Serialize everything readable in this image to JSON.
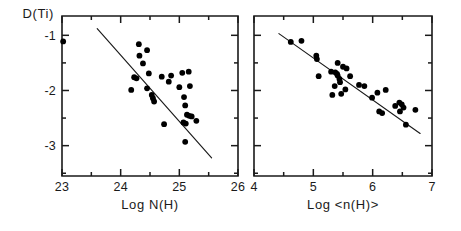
{
  "figure": {
    "background_color": "#ffffff",
    "ink_color": "#000000",
    "panel_count": 2
  },
  "chart_data": [
    {
      "type": "scatter",
      "panel_id": "left",
      "title": "",
      "xlabel": "Log N(H)",
      "ylabel": "D(Ti)",
      "xlim": [
        23,
        26
      ],
      "ylim": [
        -3.55,
        -0.65
      ],
      "xticks": [
        23,
        24,
        25,
        26
      ],
      "xticklabels": [
        "23",
        "24",
        "25",
        "26"
      ],
      "yticks": [
        -1,
        -2,
        -3
      ],
      "yticklabels": [
        "-1",
        "-2",
        "-3"
      ],
      "grid": false,
      "legend": "none",
      "marker": "filled-circle",
      "points": [
        [
          23.02,
          -1.11
        ],
        [
          24.31,
          -1.16
        ],
        [
          24.45,
          -1.27
        ],
        [
          24.32,
          -1.37
        ],
        [
          24.38,
          -1.51
        ],
        [
          24.48,
          -1.69
        ],
        [
          24.23,
          -1.76
        ],
        [
          24.27,
          -1.78
        ],
        [
          24.7,
          -1.75
        ],
        [
          24.86,
          -1.73
        ],
        [
          25.05,
          -1.68
        ],
        [
          25.16,
          -1.66
        ],
        [
          24.82,
          -1.84
        ],
        [
          24.18,
          -1.99
        ],
        [
          24.45,
          -1.96
        ],
        [
          24.53,
          -2.08
        ],
        [
          24.55,
          -2.14
        ],
        [
          24.57,
          -2.2
        ],
        [
          25.0,
          -1.94
        ],
        [
          25.18,
          -1.92
        ],
        [
          25.08,
          -2.12
        ],
        [
          25.1,
          -2.27
        ],
        [
          24.74,
          -2.61
        ],
        [
          25.13,
          -2.44
        ],
        [
          25.17,
          -2.46
        ],
        [
          25.21,
          -2.47
        ],
        [
          25.07,
          -2.58
        ],
        [
          25.11,
          -2.6
        ],
        [
          25.29,
          -2.55
        ],
        [
          25.1,
          -2.93
        ]
      ],
      "fit_line": {
        "x_start": 23.6,
        "y_start": -0.88,
        "x_end": 25.55,
        "y_end": -3.22
      }
    },
    {
      "type": "scatter",
      "panel_id": "right",
      "title": "",
      "xlabel": "Log <n(H)>",
      "ylabel": "D(Ti)",
      "xlim": [
        4,
        7
      ],
      "ylim": [
        -3.55,
        -0.65
      ],
      "xticks": [
        4,
        5,
        6,
        7
      ],
      "xticklabels": [
        "4",
        "5",
        "6",
        "7"
      ],
      "yticks": [
        -1,
        -2,
        -3
      ],
      "yticklabels": [
        "",
        "",
        ""
      ],
      "grid": false,
      "legend": "none",
      "marker": "filled-circle",
      "points": [
        [
          4.62,
          -1.12
        ],
        [
          4.8,
          -1.1
        ],
        [
          5.05,
          -1.37
        ],
        [
          5.06,
          -1.43
        ],
        [
          5.41,
          -1.5
        ],
        [
          5.5,
          -1.57
        ],
        [
          5.56,
          -1.6
        ],
        [
          5.3,
          -1.66
        ],
        [
          5.37,
          -1.67
        ],
        [
          5.4,
          -1.7
        ],
        [
          5.41,
          -1.73
        ],
        [
          5.09,
          -1.74
        ],
        [
          5.62,
          -1.74
        ],
        [
          5.44,
          -1.79
        ],
        [
          5.45,
          -1.85
        ],
        [
          5.36,
          -1.92
        ],
        [
          5.77,
          -1.9
        ],
        [
          5.86,
          -1.92
        ],
        [
          5.54,
          -1.98
        ],
        [
          5.32,
          -2.08
        ],
        [
          5.47,
          -2.06
        ],
        [
          6.08,
          -2.04
        ],
        [
          6.22,
          -1.99
        ],
        [
          5.99,
          -2.13
        ],
        [
          6.38,
          -2.28
        ],
        [
          6.11,
          -2.38
        ],
        [
          6.16,
          -2.41
        ],
        [
          6.45,
          -2.22
        ],
        [
          6.49,
          -2.25
        ],
        [
          6.52,
          -2.31
        ],
        [
          6.46,
          -2.38
        ],
        [
          6.72,
          -2.35
        ],
        [
          6.56,
          -2.62
        ]
      ],
      "fit_line": {
        "x_start": 4.42,
        "y_start": -0.97,
        "x_end": 6.8,
        "y_end": -2.78
      }
    }
  ]
}
